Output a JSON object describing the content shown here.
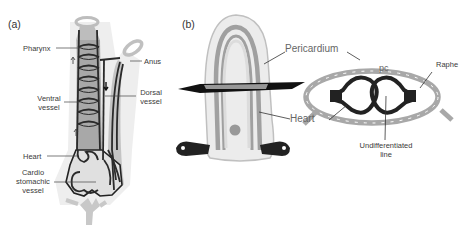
{
  "panel_a": {
    "label": "(a)",
    "labels": {
      "pharynx": "Pharynx",
      "anus": "Anus",
      "ventral_vessel_1": "Ventral",
      "ventral_vessel_2": "vessel",
      "dorsal_vessel_1": "Dorsal",
      "dorsal_vessel_2": "vessel",
      "heart": "Heart",
      "cardio_1": "Cardio",
      "cardio_2": "stomachic",
      "cardio_3": "vessel"
    }
  },
  "panel_b": {
    "label": "(b)",
    "labels": {
      "pericardium": "Pericardium",
      "heart": "Heart",
      "pc": "pc",
      "raphe": "Raphe",
      "undiff_1": "Undifferentiated",
      "undiff_2": "line"
    }
  },
  "colors": {
    "body_fill": "#e6e6e6",
    "shadow": "#c8c8c8",
    "vessel": "#2a2a2a",
    "tube_gray": "#9a9a9a",
    "heart_black": "#222222"
  }
}
